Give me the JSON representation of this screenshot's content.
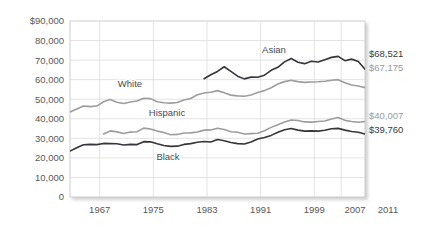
{
  "chart_data": {
    "type": "line",
    "title": "",
    "xlabel": "",
    "ylabel": "",
    "ylim": [
      0,
      90000
    ],
    "xlim": [
      1967,
      2011
    ],
    "grid": true,
    "legend_position": "inline-annotations",
    "y_ticks": [
      "$90,000",
      "80,000",
      "70,000",
      "60,000",
      "50,000",
      "40,000",
      "30,000",
      "20,000",
      "10,000",
      "0"
    ],
    "y_tick_values": [
      90000,
      80000,
      70000,
      60000,
      50000,
      40000,
      30000,
      20000,
      10000,
      0
    ],
    "x_ticks": [
      "1967",
      "1975",
      "1983",
      "1991",
      "1999",
      "2007",
      "2011"
    ],
    "x_tick_values": [
      1967,
      1975,
      1983,
      1991,
      1999,
      2007,
      2011
    ],
    "series": [
      {
        "name": "White",
        "color": "#9d9da0",
        "style": "gray",
        "label_x": 1975,
        "label_y": 54500,
        "end_value_label": "$67,175",
        "x": [
          1967,
          1968,
          1969,
          1970,
          1971,
          1972,
          1973,
          1974,
          1975,
          1976,
          1977,
          1978,
          1979,
          1980,
          1981,
          1982,
          1983,
          1984,
          1985,
          1986,
          1987,
          1988,
          1989,
          1990,
          1991,
          1992,
          1993,
          1994,
          1995,
          1996,
          1997,
          1998,
          1999,
          2000,
          2001,
          2002,
          2003,
          2004,
          2005,
          2006,
          2007,
          2008,
          2009,
          2010,
          2011
        ],
        "values": [
          43500,
          45000,
          46500,
          46200,
          46500,
          48700,
          49800,
          48500,
          47800,
          48600,
          49100,
          50500,
          50300,
          48700,
          48200,
          48000,
          48300,
          49600,
          50400,
          52300,
          53200,
          53600,
          54400,
          53300,
          52100,
          51700,
          51500,
          52200,
          53400,
          54400,
          55900,
          57800,
          59000,
          59700,
          59000,
          58600,
          58800,
          58900,
          59200,
          59700,
          60000,
          58400,
          57300,
          56800,
          55900
        ]
      },
      {
        "name": "Black",
        "color": "#35353a",
        "style": "dark",
        "label_x": 1986,
        "label_y": 26500,
        "end_value_label": "$39,760",
        "x": [
          1967,
          1968,
          1969,
          1970,
          1971,
          1972,
          1973,
          1974,
          1975,
          1976,
          1977,
          1978,
          1979,
          1980,
          1981,
          1982,
          1983,
          1984,
          1985,
          1986,
          1987,
          1988,
          1989,
          1990,
          1991,
          1992,
          1993,
          1994,
          1995,
          1996,
          1997,
          1998,
          1999,
          2000,
          2001,
          2002,
          2003,
          2004,
          2005,
          2006,
          2007,
          2008,
          2009,
          2010,
          2011
        ],
        "values": [
          23500,
          25200,
          26700,
          26900,
          26800,
          27400,
          27300,
          27200,
          26600,
          26900,
          26800,
          28300,
          28200,
          27200,
          26300,
          25900,
          26000,
          26900,
          27300,
          28000,
          28400,
          28100,
          29400,
          28800,
          27900,
          27300,
          27100,
          28100,
          29700,
          30400,
          31500,
          33100,
          34400,
          35000,
          34200,
          33700,
          33800,
          33700,
          34100,
          34900,
          35100,
          34200,
          33500,
          33100,
          32200
        ]
      },
      {
        "name": "Hispanic",
        "color": "#9d9da0",
        "style": "gray",
        "label_x": 1983,
        "label_y": 38800,
        "end_value_label": "$40,007",
        "x": [
          1972,
          1973,
          1974,
          1975,
          1976,
          1977,
          1978,
          1979,
          1980,
          1981,
          1982,
          1983,
          1984,
          1985,
          1986,
          1987,
          1988,
          1989,
          1990,
          1991,
          1992,
          1993,
          1994,
          1995,
          1996,
          1997,
          1998,
          1999,
          2000,
          2001,
          2002,
          2003,
          2004,
          2005,
          2006,
          2007,
          2008,
          2009,
          2010,
          2011
        ],
        "values": [
          32200,
          33800,
          33300,
          32500,
          33200,
          33400,
          35200,
          34800,
          33700,
          33000,
          31800,
          32000,
          32700,
          32800,
          33200,
          34200,
          34300,
          35200,
          34500,
          33400,
          33100,
          32200,
          32400,
          32600,
          33900,
          35600,
          37000,
          38300,
          39400,
          39100,
          38400,
          38300,
          38600,
          38900,
          39900,
          40700,
          39200,
          38600,
          38200,
          38600
        ]
      },
      {
        "name": "Asian",
        "color": "#35353a",
        "style": "dark",
        "label_x": 1997,
        "label_y": 76500,
        "end_value_label": "$68,521",
        "x": [
          1987,
          1988,
          1989,
          1990,
          1991,
          1992,
          1993,
          1994,
          1995,
          1996,
          1997,
          1998,
          1999,
          2000,
          2001,
          2002,
          2003,
          2004,
          2005,
          2006,
          2007,
          2008,
          2009,
          2010,
          2011
        ],
        "values": [
          60500,
          62500,
          64200,
          66600,
          64200,
          61800,
          60400,
          61300,
          61200,
          62300,
          64800,
          66300,
          69100,
          70800,
          68900,
          68200,
          69400,
          69000,
          70200,
          71400,
          71900,
          69700,
          70500,
          69300,
          65400
        ]
      }
    ],
    "end_labels": [
      {
        "text": "$68,521",
        "series": "Asian",
        "style": "dark"
      },
      {
        "text": "$67,175",
        "series": "White",
        "style": "gray"
      },
      {
        "text": "$40,007",
        "series": "Hispanic",
        "style": "gray"
      },
      {
        "text": "$39,760",
        "series": "Black",
        "style": "dark"
      }
    ]
  },
  "colors": {
    "dark_line": "#35353a",
    "gray_line": "#9d9da0",
    "grid": "#dcdcdc",
    "frame": "#c8c8c8",
    "tick_text": "#58585a",
    "background": "#ffffff"
  }
}
